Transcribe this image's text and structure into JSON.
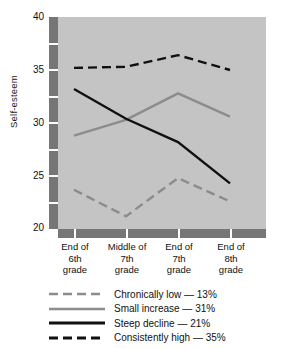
{
  "chart_data": {
    "type": "line",
    "title": "",
    "xlabel": "",
    "ylabel": "Self-esteem",
    "ylim": [
      20,
      40
    ],
    "yticks": [
      20,
      25,
      30,
      35,
      40
    ],
    "ytick_labels": [
      "20",
      "25",
      "30",
      "35",
      "40"
    ],
    "y_minor_ticks": [
      22.5,
      27.5,
      32.5,
      37.5
    ],
    "grid": false,
    "legend_position": "bottom",
    "categories": [
      "End of\n6th\ngrade",
      "Middle of\n7th\ngrade",
      "End of\n7th\ngrade",
      "End of\n8th\ngrade"
    ],
    "category_lines": [
      [
        "End of",
        "6th",
        "grade"
      ],
      [
        "Middle of",
        "7th",
        "grade"
      ],
      [
        "End of",
        "7th",
        "grade"
      ],
      [
        "End of",
        "8th",
        "grade"
      ]
    ],
    "series": [
      {
        "name": "Chronically low",
        "percent": "13%",
        "legend_label": "Chronically low — 13%",
        "color": "#8c8c8c",
        "style": "dashed",
        "width": 2.4,
        "values": [
          23.7,
          21.2,
          24.8,
          22.6
        ]
      },
      {
        "name": "Small increase",
        "percent": "31%",
        "legend_label": "Small increase — 31%",
        "color": "#8c8c8c",
        "style": "solid",
        "width": 2.4,
        "values": [
          28.8,
          30.3,
          32.8,
          30.6
        ]
      },
      {
        "name": "Steep decline",
        "percent": "21%",
        "legend_label": "Steep decline — 21%",
        "color": "#111111",
        "style": "solid",
        "width": 2.4,
        "values": [
          33.2,
          30.4,
          28.2,
          24.3
        ]
      },
      {
        "name": "Consistently high",
        "percent": "35%",
        "legend_label": "Consistently high — 35%",
        "color": "#111111",
        "style": "dashed",
        "width": 2.4,
        "values": [
          35.2,
          35.3,
          36.4,
          35.0
        ]
      }
    ]
  },
  "axes": {
    "y_title": "Self-esteem",
    "y_tick_labels": [
      "40",
      "35",
      "30",
      "25",
      "20"
    ],
    "axis_color": "#767676",
    "tick_color": "#ffffff",
    "plot_background": "#c4c4c4"
  },
  "legend": {
    "items": [
      "Chronically low — 13%",
      "Small increase — 31%",
      "Steep decline — 21%",
      "Consistently high — 35%"
    ]
  }
}
